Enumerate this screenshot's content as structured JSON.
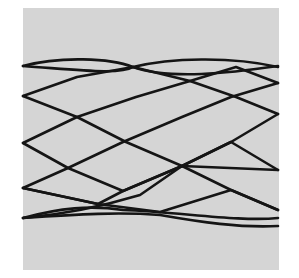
{
  "figure": {
    "background_color": "#d5d5d5",
    "trace_color": "#151515",
    "paths": [
      "M23,66 C60,56 110,58 133,67 C170,58 230,56 278,67",
      "M23,66 C80,70 120,75 133,67 C170,80 230,73 278,66",
      "M23,96 L77,77 L133,67 L190,81 L236,97 L278,114",
      "M23,96 L77,117 L136,97 L190,81 L236,67 L278,83",
      "M23,143 L77,117 L126,142 L182,166 L231,190 L278,210",
      "M23,143 L68,168 L123,191 L182,166 L231,142 L278,114",
      "M23,188 L68,168 L123,142 L182,117 L231,97 L278,83",
      "M23,188 L98,204 L123,191 L182,166 L278,170",
      "M23,218 C70,214 110,204 140,195 L182,166 L231,142 L278,170",
      "M23,218 C80,214 120,212 160,215 C200,222 240,228 278,226",
      "M23,188 L98,204 L160,212 L231,190 L278,210",
      "M23,218 C60,208 90,205 123,210 C180,212 240,222 278,218"
    ]
  }
}
